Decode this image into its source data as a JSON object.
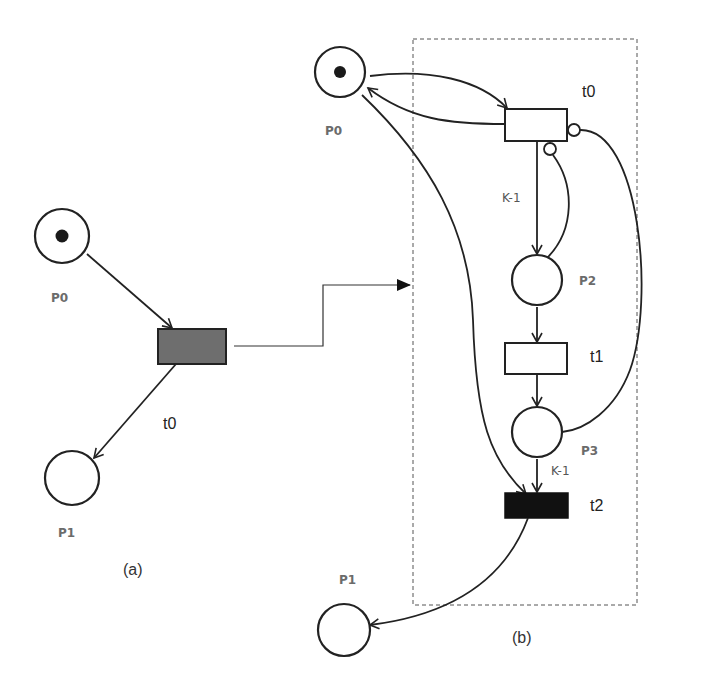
{
  "diagram": {
    "type": "petri-net",
    "panel_a": {
      "caption": "(a)",
      "places": [
        {
          "id": "P0",
          "label": "P0",
          "tokens": 1
        },
        {
          "id": "P1",
          "label": "P1",
          "tokens": 0
        }
      ],
      "transitions": [
        {
          "id": "t0",
          "label": "t0",
          "fill": "#6e6e6e"
        }
      ],
      "arcs": [
        {
          "from": "P0",
          "to": "t0",
          "kind": "normal"
        },
        {
          "from": "t0",
          "to": "P1",
          "kind": "normal"
        }
      ]
    },
    "panel_b": {
      "caption": "(b)",
      "places": [
        {
          "id": "P0",
          "label": "P0",
          "tokens": 1
        },
        {
          "id": "P2",
          "label": "P2",
          "tokens": 0
        },
        {
          "id": "P3",
          "label": "P3",
          "tokens": 0
        },
        {
          "id": "P1",
          "label": "P1",
          "tokens": 0
        }
      ],
      "transitions": [
        {
          "id": "t0",
          "label": "t0",
          "fill": "#ffffff"
        },
        {
          "id": "t1",
          "label": "t1",
          "fill": "#ffffff"
        },
        {
          "id": "t2",
          "label": "t2",
          "fill": "#111111"
        }
      ],
      "arcs": [
        {
          "from": "P0",
          "to": "t0",
          "kind": "normal"
        },
        {
          "from": "t0",
          "to": "P0",
          "kind": "normal"
        },
        {
          "from": "t0",
          "to": "P2",
          "kind": "normal",
          "weight": "K-1"
        },
        {
          "from": "P2",
          "to": "t0",
          "kind": "inhibitor"
        },
        {
          "from": "P3",
          "to": "t0",
          "kind": "inhibitor"
        },
        {
          "from": "P2",
          "to": "t1",
          "kind": "normal"
        },
        {
          "from": "t1",
          "to": "P3",
          "kind": "normal"
        },
        {
          "from": "P3",
          "to": "t2",
          "kind": "normal",
          "weight": "K-1"
        },
        {
          "from": "P0",
          "to": "t2",
          "kind": "normal"
        },
        {
          "from": "t2",
          "to": "P1",
          "kind": "normal"
        }
      ],
      "weights": {
        "t0_to_P2": "K-1",
        "P3_to_t2": "K-1"
      }
    },
    "refinement_arrow": {
      "from": "panel_a.t0",
      "to": "panel_b"
    }
  }
}
